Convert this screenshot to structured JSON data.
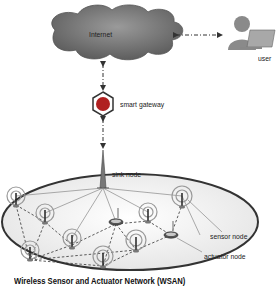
{
  "diagram": {
    "title": "Wireless Sensor and Actuator Network (WSAN)",
    "nodes": {
      "internet": {
        "label": "Internet"
      },
      "user": {
        "label": "user"
      },
      "gateway": {
        "label": "smart gateway"
      },
      "sink": {
        "label": "sink node"
      },
      "sensor": {
        "label": "sensor node"
      },
      "actuator": {
        "label": "actuator node"
      }
    },
    "colors": {
      "cloud": "#7a7a7a",
      "gateway_fill": "#b02020",
      "user_body": "#8a8a8a",
      "line": "#555555",
      "ring": "#9a9a9a",
      "ellipse_fill": "#f4f4f4",
      "ellipse_stroke": "#333333"
    }
  }
}
